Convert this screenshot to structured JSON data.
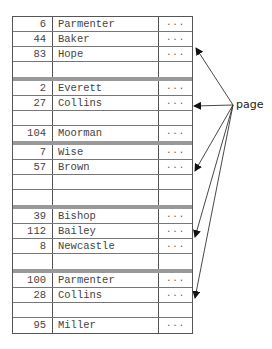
{
  "pages": [
    {
      "rows": [
        {
          "id": "6",
          "name": "Parmenter",
          "more": "..."
        },
        {
          "id": "44",
          "name": "Baker",
          "more": "..."
        },
        {
          "id": "83",
          "name": "Hope",
          "more": "..."
        },
        {
          "id": "",
          "name": "",
          "more": ""
        }
      ]
    },
    {
      "rows": [
        {
          "id": "2",
          "name": "Everett",
          "more": "..."
        },
        {
          "id": "27",
          "name": "Collins",
          "more": "..."
        },
        {
          "id": "",
          "name": "",
          "more": ""
        },
        {
          "id": "104",
          "name": "Moorman",
          "more": "..."
        }
      ]
    },
    {
      "rows": [
        {
          "id": "7",
          "name": "Wise",
          "more": "..."
        },
        {
          "id": "57",
          "name": "Brown",
          "more": "..."
        },
        {
          "id": "",
          "name": "",
          "more": ""
        },
        {
          "id": "",
          "name": "",
          "more": ""
        }
      ]
    },
    {
      "rows": [
        {
          "id": "39",
          "name": "Bishop",
          "more": "..."
        },
        {
          "id": "112",
          "name": "Bailey",
          "more": "..."
        },
        {
          "id": "8",
          "name": "Newcastle",
          "more": "..."
        },
        {
          "id": "",
          "name": "",
          "more": ""
        }
      ]
    },
    {
      "rows": [
        {
          "id": "100",
          "name": "Parmenter",
          "more": "..."
        },
        {
          "id": "28",
          "name": "Collins",
          "more": "..."
        },
        {
          "id": "",
          "name": "",
          "more": ""
        },
        {
          "id": "95",
          "name": "Miller",
          "more": "..."
        }
      ]
    }
  ],
  "annotation": {
    "label": "page"
  }
}
